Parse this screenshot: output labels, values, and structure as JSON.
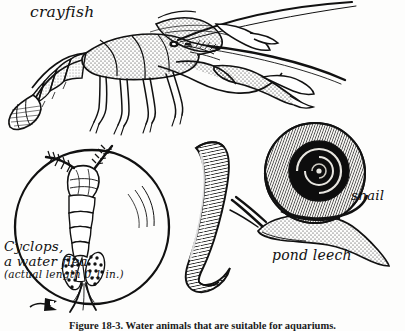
{
  "figure": {
    "background_color": "#fdfdfc",
    "ink_color": "#111111",
    "caption": {
      "number": "Figure 18-3.",
      "text": "Water animals that are suitable for aquariums.",
      "full": "Figure 18-3.  Water animals that are suitable for aquariums."
    },
    "labels": {
      "crayfish": "crayfish",
      "snail": "snail",
      "pond_leech": "pond leech",
      "cyclops_line1": "Cyclops,",
      "cyclops_line2": "a water flea",
      "cyclops_line3": "(actual length 0.1 in.)"
    },
    "specimens": [
      {
        "name": "crayfish",
        "label": "crayfish",
        "description": "stippled line drawing of a crayfish in left profile with large claw, segmented abdomen, tail fan, walking legs and two long antennae"
      },
      {
        "name": "cyclops",
        "label": "Cyclops, a water flea",
        "note": "(actual length 0.1 in.)",
        "description": "magnified copepod shown inside a large circle representing a magnifying lens / water drop, with egg sacs and setae"
      },
      {
        "name": "pond-leech",
        "label": "pond leech",
        "description": "curved hatched elongated body of a leech"
      },
      {
        "name": "snail",
        "label": "snail",
        "description": "pond snail with coiled spiral shell, stippled foot and two tentacles"
      }
    ]
  }
}
